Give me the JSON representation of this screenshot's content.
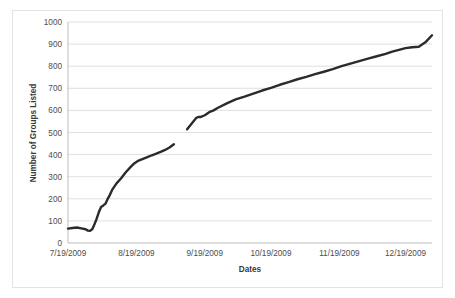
{
  "chart_data": {
    "type": "line",
    "title": "",
    "xlabel": "Dates",
    "ylabel": "Number of Groups Listed",
    "ylim": [
      0,
      1000
    ],
    "ytick_labels": [
      "1000",
      "900",
      "800",
      "700",
      "600",
      "500",
      "400",
      "300",
      "200",
      "100",
      "0"
    ],
    "ytick_values": [
      1000,
      900,
      800,
      700,
      600,
      500,
      400,
      300,
      200,
      100,
      0
    ],
    "xtick_labels": [
      "7/19/2009",
      "8/19/2009",
      "9/19/2009",
      "10/19/2009",
      "11/19/2009",
      "12/19/2009"
    ],
    "xtick_values": [
      0,
      31,
      62,
      92,
      123,
      153
    ],
    "xlim": [
      0,
      165
    ],
    "grid": "horizontal",
    "legend": "none",
    "line_color": "#2b2b2b",
    "series": [
      {
        "name": "Number of Groups Listed",
        "has_gap": true,
        "segments": [
          {
            "name": "segment-1",
            "x": [
              0,
              2,
              4,
              6,
              8,
              9,
              10,
              11,
              12,
              13,
              14,
              15,
              16,
              17,
              18,
              19,
              20,
              22,
              24,
              26,
              28,
              30,
              32,
              34,
              36,
              38,
              40,
              42,
              44,
              46,
              48
            ],
            "y": [
              65,
              68,
              70,
              66,
              62,
              56,
              55,
              62,
              85,
              110,
              140,
              163,
              170,
              178,
              200,
              218,
              240,
              270,
              292,
              318,
              340,
              360,
              373,
              381,
              389,
              397,
              404,
              412,
              421,
              432,
              447
            ]
          },
          {
            "name": "segment-2",
            "x": [
              54,
              56,
              58,
              59,
              60,
              62,
              64,
              66,
              68,
              72,
              76,
              80,
              84,
              88,
              92,
              96,
              100,
              104,
              108,
              112,
              116,
              120,
              124,
              128,
              132,
              136,
              140,
              144,
              147,
              150,
              153,
              156,
              159,
              162,
              165
            ],
            "y": [
              515,
              540,
              565,
              570,
              570,
              578,
              592,
              600,
              612,
              632,
              650,
              662,
              676,
              690,
              702,
              716,
              728,
              741,
              752,
              764,
              775,
              787,
              800,
              812,
              823,
              834,
              845,
              856,
              866,
              874,
              882,
              886,
              888,
              908,
              940
            ]
          }
        ]
      }
    ],
    "note": "Line has a data gap between approximately 9/5/2009 and 9/12/2009"
  },
  "axis": {
    "y_title": "Number of Groups Listed",
    "x_title": "Dates"
  }
}
